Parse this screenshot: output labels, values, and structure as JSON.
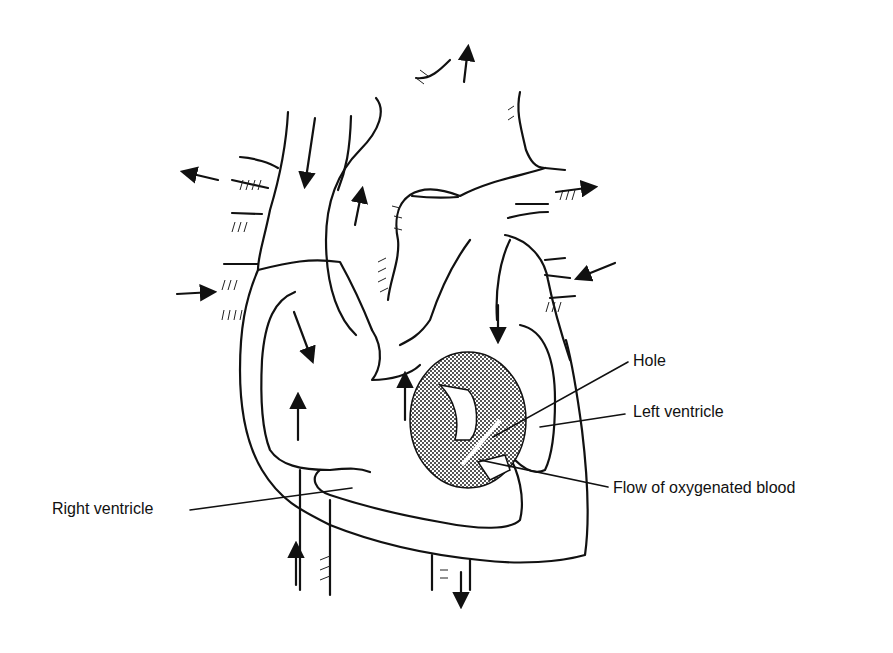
{
  "diagram": {
    "labels": {
      "hole": "Hole",
      "left_ventricle": "Left ventricle",
      "flow": "Flow of oxygenated blood",
      "right_ventricle": "Right ventricle"
    },
    "colors": {
      "ink": "#111111",
      "hole_fill": "#7a7a7a",
      "background": "#ffffff"
    }
  }
}
